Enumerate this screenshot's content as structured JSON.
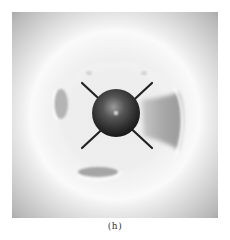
{
  "figure": {
    "caption": "(h)",
    "panel": {
      "background_colors": {
        "outer_edge": "#a9a9a9",
        "outer_ring": "#fafafa",
        "inner_field": "#ececec"
      },
      "central_sphere": {
        "color_dark": "#1c1c1c",
        "color_mid": "#555555",
        "highlight": "#f2f2f2"
      },
      "bonds": {
        "count": 4,
        "color": "#222222"
      },
      "features": [
        "left-lobe-shadow",
        "right-lobe-shadow",
        "bottom-lobe-shadow",
        "top-left-dot",
        "top-right-dot"
      ]
    }
  }
}
